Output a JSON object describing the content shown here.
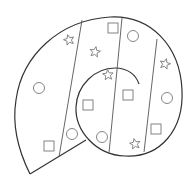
{
  "diagram": {
    "title": "",
    "colors": {
      "outline": "#333333",
      "divider": "#555555",
      "shape": "#777777",
      "background": "#ffffff"
    },
    "shape_counts": {
      "stars": 5,
      "circles": 5,
      "squares": 5
    }
  }
}
